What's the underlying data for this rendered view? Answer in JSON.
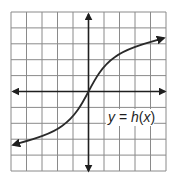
{
  "diagram": {
    "type": "function-graph",
    "function_label": {
      "y": "y",
      "equals": " = ",
      "func": "h",
      "open": "(",
      "x": "x",
      "close": ")"
    },
    "grid": {
      "columns": 10,
      "rows": 10,
      "x_range": [
        -5,
        5
      ],
      "y_range": [
        -5,
        5
      ]
    },
    "curve_description": "increasing S-shaped curve through the origin, arrows at both ends",
    "colors": {
      "grid": "#8a8a8a",
      "axis": "#1f1f1f",
      "curve": "#2a2a2a",
      "background": "#ffffff"
    }
  }
}
